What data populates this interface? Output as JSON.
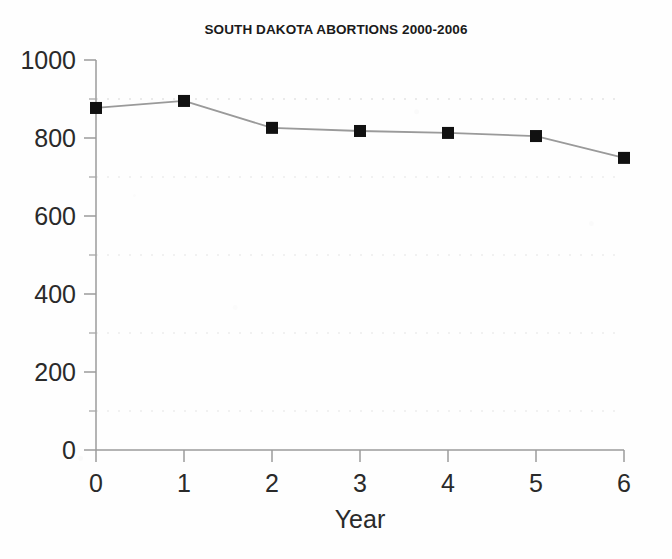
{
  "chart_data": {
    "type": "line",
    "title": "SOUTH DAKOTA ABORTIONS 2000-2006",
    "xlabel": "Year",
    "ylabel": "",
    "x": [
      0,
      1,
      2,
      3,
      4,
      5,
      6
    ],
    "values": [
      877,
      895,
      826,
      818,
      813,
      805,
      749
    ],
    "series": [
      {
        "name": "Abortions",
        "values": [
          877,
          895,
          826,
          818,
          813,
          805,
          749
        ]
      }
    ],
    "xlim": [
      0,
      6
    ],
    "ylim": [
      0,
      1000
    ],
    "xticks": [
      "0",
      "1",
      "2",
      "3",
      "4",
      "5",
      "6"
    ],
    "yticks": [
      "0",
      "200",
      "400",
      "600",
      "800",
      "1000"
    ],
    "y_minor_gridlines": [
      100,
      300,
      500,
      700,
      900
    ],
    "grid": true,
    "grid_style": "dotted-minor-only",
    "legend": "none",
    "marker": "filled-square",
    "marker_color": "#111111",
    "line_color": "#9a9a9a",
    "background_color": "#fefefe"
  },
  "axes": {
    "y_tick_labels": [
      "1000",
      "800",
      "600",
      "400",
      "200",
      "0"
    ],
    "x_tick_labels": [
      "0",
      "1",
      "2",
      "3",
      "4",
      "5",
      "6"
    ],
    "x_axis_title": "Year"
  },
  "colors": {
    "title_color": "#1a1a1a",
    "axis_color": "#8c8c8c",
    "tick_label_color": "#2a2a2a",
    "gridline_color": "#ececec",
    "marker_color": "#111111",
    "line_color": "#9a9a9a",
    "page_background": "#fefefe"
  }
}
